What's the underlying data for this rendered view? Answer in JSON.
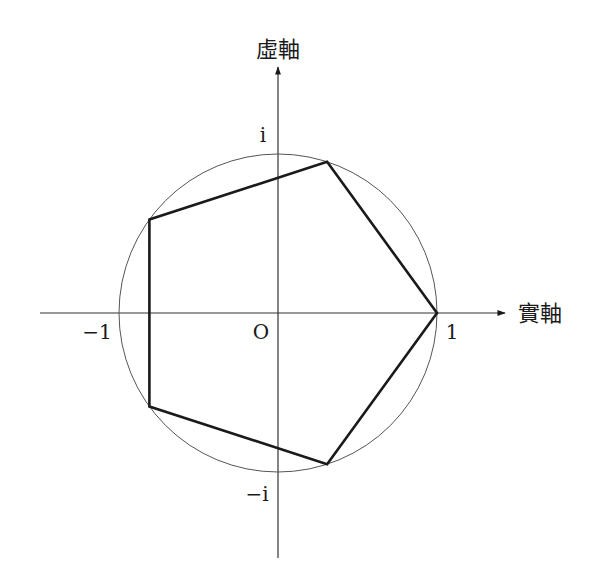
{
  "figure": {
    "axes": {
      "real_axis_label": "實軸",
      "imaginary_axis_label": "虛軸",
      "origin_label": "O",
      "tick_labels": {
        "positive_real": "1",
        "negative_real": "−1",
        "positive_imaginary": "i",
        "negative_imaginary": "−i"
      }
    },
    "circle": {
      "center": [
        0,
        0
      ],
      "radius": 1,
      "stroke": "#555555"
    },
    "polygon": {
      "name": "regular pentagon",
      "vertices_deg": [
        0,
        72,
        144,
        216,
        288
      ],
      "stroke": "#1a1a1a"
    },
    "colors": {
      "axis": "#333333",
      "background": "#ffffff"
    }
  }
}
